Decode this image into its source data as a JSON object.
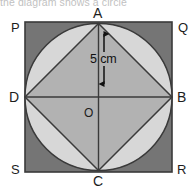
{
  "caption": {
    "text": "the diagram shows a circle"
  },
  "figure": {
    "labels": {
      "square_top_left": "P",
      "square_top_right": "Q",
      "square_bottom_right": "R",
      "square_bottom_left": "S",
      "circle_top": "A",
      "circle_right": "B",
      "circle_bottom": "C",
      "circle_left": "D",
      "center": "O"
    },
    "dimension": {
      "value": "5 cm",
      "measures": "radius-OA"
    },
    "colors": {
      "square_fill": "#757575",
      "circle_fill": "#d7d7d7",
      "rhombus_fill": "#b2b2b2",
      "stroke": "#3a3a3a",
      "background": "#ffffff",
      "label_color": "#1d1d1d"
    },
    "geometry": {
      "square": {
        "left": 25,
        "top": 22,
        "right": 172,
        "bottom": 172
      },
      "circle": {
        "cx": 98.5,
        "cy": 97,
        "r": 73.5
      },
      "rhombus_vertices": [
        {
          "name": "A",
          "x": 98.5,
          "y": 23.5
        },
        {
          "name": "B",
          "x": 172,
          "y": 97
        },
        {
          "name": "C",
          "x": 98.5,
          "y": 170.5
        },
        {
          "name": "D",
          "x": 25,
          "y": 97
        }
      ]
    }
  }
}
